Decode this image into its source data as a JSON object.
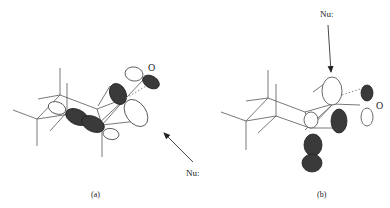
{
  "figure": {
    "panels": [
      {
        "id": "a",
        "caption": "(a)",
        "atom_label": "O",
        "nucleophile_label": "Nu:",
        "attack_direction": "from lower right"
      },
      {
        "id": "b",
        "caption": "(b)",
        "atom_label": "O",
        "nucleophile_label": "Nu:",
        "attack_direction": "from above"
      }
    ],
    "colors": {
      "shaded_lobe": "#3a3a3a",
      "open_lobe": "#ffffff",
      "line": "#555555"
    }
  }
}
